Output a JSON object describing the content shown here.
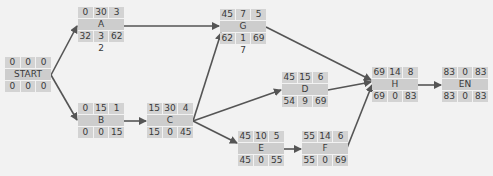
{
  "diagram": {
    "type": "activity-on-node network",
    "nodes": [
      {
        "id": "START",
        "name": "START",
        "top": [
          "0",
          "0",
          "0"
        ],
        "bottom": [
          "0",
          "0",
          "0"
        ],
        "x": 5,
        "y": 57
      },
      {
        "id": "A",
        "name": "A",
        "top": [
          "0",
          "30",
          "3"
        ],
        "bottom": [
          "32",
          "3",
          "62"
        ],
        "below": "2",
        "x": 78,
        "y": 7
      },
      {
        "id": "B",
        "name": "B",
        "top": [
          "0",
          "15",
          "1"
        ],
        "bottom": [
          "0",
          "0",
          "15"
        ],
        "x": 78,
        "y": 103
      },
      {
        "id": "C",
        "name": "C",
        "top": [
          "15",
          "30",
          "4"
        ],
        "bottom": [
          "15",
          "0",
          "45"
        ],
        "x": 147,
        "y": 103
      },
      {
        "id": "G",
        "name": "G",
        "top": [
          "45",
          "7",
          "5"
        ],
        "bottom": [
          "62",
          "1",
          "69"
        ],
        "below": "7",
        "x": 220,
        "y": 9
      },
      {
        "id": "D",
        "name": "D",
        "top": [
          "45",
          "15",
          "6"
        ],
        "bottom": [
          "54",
          "9",
          "69"
        ],
        "x": 282,
        "y": 72
      },
      {
        "id": "E",
        "name": "E",
        "top": [
          "45",
          "10",
          "5"
        ],
        "bottom": [
          "45",
          "0",
          "55"
        ],
        "x": 238,
        "y": 131
      },
      {
        "id": "F",
        "name": "F",
        "top": [
          "55",
          "14",
          "6"
        ],
        "bottom": [
          "55",
          "0",
          "69"
        ],
        "x": 302,
        "y": 131
      },
      {
        "id": "H",
        "name": "H",
        "top": [
          "69",
          "14",
          "8"
        ],
        "bottom": [
          "69",
          "0",
          "83"
        ],
        "x": 372,
        "y": 67
      },
      {
        "id": "EN",
        "name": "EN",
        "top": [
          "83",
          "0",
          "83"
        ],
        "bottom": [
          "83",
          "0",
          "83"
        ],
        "x": 442,
        "y": 67
      }
    ],
    "edges": [
      [
        "START",
        "A"
      ],
      [
        "START",
        "B"
      ],
      [
        "A",
        "G"
      ],
      [
        "B",
        "C"
      ],
      [
        "C",
        "G"
      ],
      [
        "C",
        "D"
      ],
      [
        "C",
        "E"
      ],
      [
        "E",
        "F"
      ],
      [
        "G",
        "H"
      ],
      [
        "D",
        "H"
      ],
      [
        "F",
        "H"
      ],
      [
        "H",
        "EN"
      ]
    ],
    "colors": {
      "background": "#f2f2f2",
      "cell": "#d3d3d3",
      "edge": "#555555",
      "text": "#3a3a3a"
    }
  }
}
